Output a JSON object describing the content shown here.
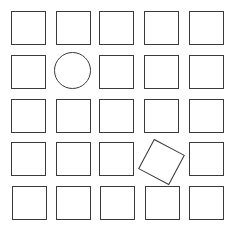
{
  "figure": {
    "rows": 5,
    "cols": 5,
    "stroke_color": "#3a3a3a",
    "background": "#ffffff",
    "cells": [
      {
        "row": 1,
        "col": 1,
        "shape": "square",
        "x": 11,
        "y": 11
      },
      {
        "row": 1,
        "col": 2,
        "shape": "square",
        "x": 56,
        "y": 11
      },
      {
        "row": 1,
        "col": 3,
        "shape": "square",
        "x": 99,
        "y": 11
      },
      {
        "row": 1,
        "col": 4,
        "shape": "square",
        "x": 144,
        "y": 11
      },
      {
        "row": 1,
        "col": 5,
        "shape": "square",
        "x": 189,
        "y": 11
      },
      {
        "row": 2,
        "col": 1,
        "shape": "square",
        "x": 11,
        "y": 55
      },
      {
        "row": 2,
        "col": 2,
        "shape": "circle",
        "x": 54,
        "y": 52
      },
      {
        "row": 2,
        "col": 3,
        "shape": "square",
        "x": 99,
        "y": 55
      },
      {
        "row": 2,
        "col": 4,
        "shape": "square",
        "x": 144,
        "y": 55
      },
      {
        "row": 2,
        "col": 5,
        "shape": "square",
        "x": 189,
        "y": 55
      },
      {
        "row": 3,
        "col": 1,
        "shape": "square",
        "x": 11,
        "y": 99
      },
      {
        "row": 3,
        "col": 2,
        "shape": "square",
        "x": 56,
        "y": 99
      },
      {
        "row": 3,
        "col": 3,
        "shape": "square",
        "x": 99,
        "y": 99
      },
      {
        "row": 3,
        "col": 4,
        "shape": "square",
        "x": 144,
        "y": 99
      },
      {
        "row": 3,
        "col": 5,
        "shape": "square",
        "x": 189,
        "y": 99
      },
      {
        "row": 4,
        "col": 1,
        "shape": "square",
        "x": 11,
        "y": 142
      },
      {
        "row": 4,
        "col": 2,
        "shape": "square",
        "x": 56,
        "y": 142
      },
      {
        "row": 4,
        "col": 3,
        "shape": "square",
        "x": 99,
        "y": 142
      },
      {
        "row": 4,
        "col": 4,
        "shape": "rotated-square",
        "x": 144,
        "y": 145,
        "rotation_deg": 28
      },
      {
        "row": 4,
        "col": 5,
        "shape": "square",
        "x": 189,
        "y": 142
      },
      {
        "row": 5,
        "col": 1,
        "shape": "square",
        "x": 12,
        "y": 186
      },
      {
        "row": 5,
        "col": 2,
        "shape": "square",
        "x": 56,
        "y": 186
      },
      {
        "row": 5,
        "col": 3,
        "shape": "square",
        "x": 100,
        "y": 186
      },
      {
        "row": 5,
        "col": 4,
        "shape": "square",
        "x": 145,
        "y": 186
      },
      {
        "row": 5,
        "col": 5,
        "shape": "square",
        "x": 189,
        "y": 186
      }
    ]
  }
}
